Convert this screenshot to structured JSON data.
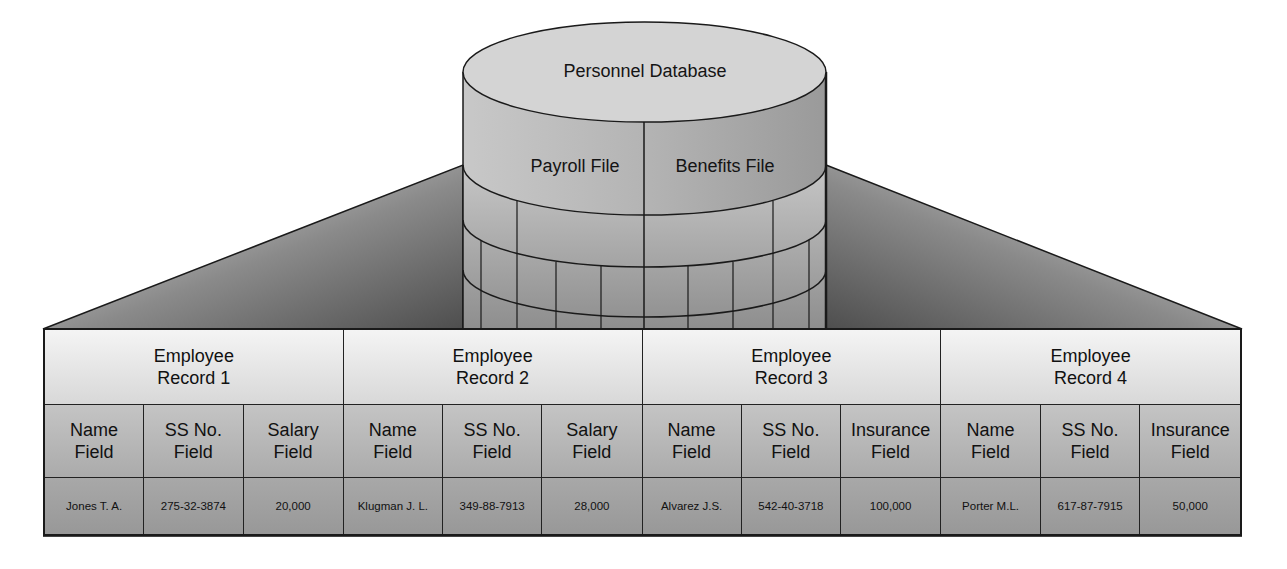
{
  "database": {
    "title": "Personnel Database",
    "files": [
      {
        "label": "Payroll File"
      },
      {
        "label": "Benefits File"
      }
    ]
  },
  "colors": {
    "outline": "#1a1a1a",
    "wing_dark": "#5a5a5a",
    "wing_light": "#e6e6e6",
    "cylinder_top": "#d2d2d2",
    "cylinder_side": "#a9a9a9"
  },
  "records": [
    {
      "title": "Employee\nRecord 1",
      "fields": [
        "Name\nField",
        "SS No.\nField",
        "Salary\nField"
      ],
      "values": [
        "Jones T. A.",
        "275-32-3874",
        "20,000"
      ]
    },
    {
      "title": "Employee\nRecord 2",
      "fields": [
        "Name\nField",
        "SS No.\nField",
        "Salary\nField"
      ],
      "values": [
        "Klugman J. L.",
        "349-88-7913",
        "28,000"
      ]
    },
    {
      "title": "Employee\nRecord 3",
      "fields": [
        "Name\nField",
        "SS No.\nField",
        "Insurance\nField"
      ],
      "values": [
        "Alvarez J.S.",
        "542-40-3718",
        "100,000"
      ]
    },
    {
      "title": "Employee\nRecord 4",
      "fields": [
        "Name\nField",
        "SS No.\nField",
        "Insurance\nField"
      ],
      "values": [
        "Porter M.L.",
        "617-87-7915",
        "50,000"
      ]
    }
  ]
}
